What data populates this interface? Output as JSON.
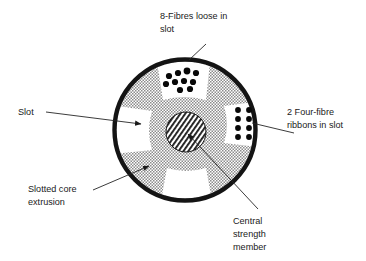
{
  "figure": {
    "name": "slotted-core-optical-cable-cross-section",
    "background_color": "#ffffff",
    "ink_color": "#1a1a1a"
  },
  "labels": {
    "fibres_loose": {
      "line1": "8-Fibres loose in",
      "line2": "slot"
    },
    "slot": {
      "line1": "Slot"
    },
    "ribbons": {
      "line1": "2 Four-fibre",
      "line2": "ribbons in slot"
    },
    "slotted_core": {
      "line1": "Slotted core",
      "line2": "extrusion"
    },
    "central_member": {
      "line1": "Central",
      "line2": "strength",
      "line3": "member"
    }
  },
  "diagram": {
    "sheath": {
      "name": "outer-sheath",
      "cx": 185,
      "cy": 130,
      "r": 71,
      "stroke_color": "#141414",
      "stroke_width": 4.2
    },
    "core": {
      "name": "slotted-core-extrusion",
      "cx": 185,
      "cy": 130,
      "r": 68,
      "fill_pattern": "checker-grey",
      "pattern_color": "#8c8c8c"
    },
    "central_strength_member": {
      "name": "central-strength-member",
      "cx": 186,
      "cy": 132,
      "r": 20,
      "fill_pattern": "diagonal-hatch",
      "stroke_color": "#1a1a1a"
    },
    "slots": [
      {
        "name": "slot-top",
        "angle_deg": 90,
        "content": "loose-fibres"
      },
      {
        "name": "slot-right",
        "angle_deg": 0,
        "content": "fibre-ribbons"
      },
      {
        "name": "slot-left",
        "angle_deg": 180,
        "content": "empty"
      },
      {
        "name": "slot-bottom",
        "angle_deg": 270,
        "content": "empty"
      },
      {
        "name": "slot-upper-left",
        "angle_deg": 148,
        "content": "empty"
      }
    ],
    "loose_fibres": {
      "name": "loose-fibre-group",
      "count": 10,
      "dot_color": "#080808",
      "dot_radius": 3.1,
      "positions": [
        [
          169,
          76
        ],
        [
          178,
          73
        ],
        [
          187,
          71
        ],
        [
          195,
          72
        ],
        [
          166,
          84
        ],
        [
          175,
          82
        ],
        [
          184,
          81
        ],
        [
          193,
          82
        ],
        [
          180,
          90
        ],
        [
          189,
          90
        ]
      ]
    },
    "fibre_ribbons": {
      "name": "fibre-ribbon-group",
      "ribbon_count": 2,
      "fibres_per_ribbon": 4,
      "dot_color": "#080808",
      "dot_radius": 2.9,
      "positions": [
        [
          238,
          110
        ],
        [
          249,
          110
        ],
        [
          238,
          119
        ],
        [
          249,
          119
        ],
        [
          238,
          128
        ],
        [
          249,
          128
        ],
        [
          238,
          137
        ],
        [
          249,
          137
        ]
      ]
    }
  },
  "leaders": {
    "fibres_loose": {
      "name": "leader-fibres-loose",
      "points": "206,44 188,60"
    },
    "slot": {
      "name": "leader-slot",
      "points": "46,113 142,122"
    },
    "ribbons": {
      "name": "leader-ribbons",
      "points": "292,132 252,122"
    },
    "slotted_core": {
      "name": "leader-slotted-core",
      "points": "96,190 150,166"
    },
    "central_member": {
      "name": "leader-central-member",
      "points": "256,208 186,133"
    }
  },
  "label_positions": {
    "fibres_loose": {
      "x": 160,
      "y": 16
    },
    "slot": {
      "x": 18,
      "y": 114
    },
    "ribbons": {
      "x": 286,
      "y": 113
    },
    "slotted_core": {
      "x": 27,
      "y": 190
    },
    "central_member": {
      "x": 232,
      "y": 222
    }
  }
}
